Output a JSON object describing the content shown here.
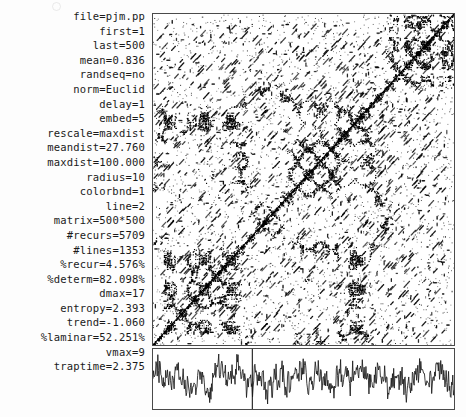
{
  "window": {
    "title": "Recurrence Quantification Analysis Output",
    "background_color": "#fdfdfd",
    "ink_color": "#1a1a1a",
    "border_color": "#4a4a4a"
  },
  "parameters": [
    {
      "key": "file",
      "value": "pjm.pp"
    },
    {
      "key": "first",
      "value": "1"
    },
    {
      "key": "last",
      "value": "500"
    },
    {
      "key": "mean",
      "value": "0.836"
    },
    {
      "key": "randseq",
      "value": "no"
    },
    {
      "key": "norm",
      "value": "Euclid"
    },
    {
      "key": "delay",
      "value": "1"
    },
    {
      "key": "embed",
      "value": "5"
    },
    {
      "key": "rescale",
      "value": "maxdist"
    },
    {
      "key": "meandist",
      "value": "27.760"
    },
    {
      "key": "maxdist",
      "value": "100.000"
    },
    {
      "key": "radius",
      "value": "10"
    },
    {
      "key": "colorbnd",
      "value": "1"
    },
    {
      "key": "line",
      "value": "2"
    },
    {
      "key": "matrix",
      "value": "500*500"
    },
    {
      "key": "#recurs",
      "value": "5709"
    },
    {
      "key": "#lines",
      "value": "1353"
    },
    {
      "key": "%recur",
      "value": "4.576%"
    },
    {
      "key": "%determ",
      "value": "82.098%"
    },
    {
      "key": "dmax",
      "value": "17"
    },
    {
      "key": "entropy",
      "value": "2.393"
    },
    {
      "key": "trend",
      "value": "-1.060"
    },
    {
      "key": "%laminar",
      "value": "52.251%"
    },
    {
      "key": "vmax",
      "value": "9"
    },
    {
      "key": "traptime",
      "value": "2.375"
    }
  ],
  "chart_data": [
    {
      "type": "heatmap",
      "name": "recurrence-plot",
      "title": "",
      "xlabel": "",
      "ylabel": "",
      "xlim": [
        1,
        500
      ],
      "ylim": [
        1,
        500
      ],
      "grid": false,
      "legend": "none",
      "matrix_size": "500*500",
      "recurrence_points": 5709,
      "recurrence_rate_percent": 4.576,
      "determinism_percent": 82.098,
      "diagonal_lines": 1353,
      "dmax": 17,
      "entropy": 2.393,
      "trend": -1.06,
      "laminarity_percent": 52.251,
      "vmax": 9,
      "trapping_time": 2.375,
      "radius": 10,
      "embedding_dimension": 5,
      "delay": 1,
      "norm": "Euclid",
      "rescale": "maxdist",
      "point_color": "#000000",
      "background_color": "#ffffff",
      "line_of_identity": true,
      "description": "Recurrence plot of pjm.pp samples 1-500; sparse black points with short diagonal segments and a continuous main diagonal from lower-left to upper-right."
    },
    {
      "type": "line",
      "name": "time-series",
      "title": "",
      "xlabel": "",
      "ylabel": "",
      "xlim": [
        1,
        500
      ],
      "ylim": [
        0,
        1
      ],
      "grid": false,
      "legend": "none",
      "series": [
        {
          "name": "pjm.pp",
          "mean": 0.836,
          "n_points": 500,
          "color": "#1a1a1a",
          "description": "Noisy oscillating signal with dense high-frequency fluctuation across 500 samples."
        }
      ],
      "marker_line_x": 165,
      "marker_line_color": "#1a1a1a"
    }
  ]
}
